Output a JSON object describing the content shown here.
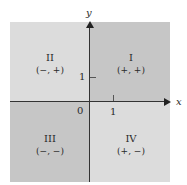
{
  "diagram": {
    "type": "coordinate-plane-quadrants",
    "axes": {
      "x_label": "x",
      "y_label": "y",
      "origin_label": "0",
      "x_tick_label": "1",
      "y_tick_label": "1"
    },
    "quadrants": [
      {
        "id": "I",
        "numeral": "I",
        "signs": "(+, +)",
        "color": "#c6c6c6"
      },
      {
        "id": "II",
        "numeral": "II",
        "signs": "(−, +)",
        "color": "#dcdcdc"
      },
      {
        "id": "III",
        "numeral": "III",
        "signs": "(−, −)",
        "color": "#c6c6c6"
      },
      {
        "id": "IV",
        "numeral": "IV",
        "signs": "(+, −)",
        "color": "#dcdcdc"
      }
    ],
    "colors": {
      "dark_quadrant": "#c6c6c6",
      "light_quadrant": "#dcdcdc",
      "axis": "#333333"
    }
  }
}
